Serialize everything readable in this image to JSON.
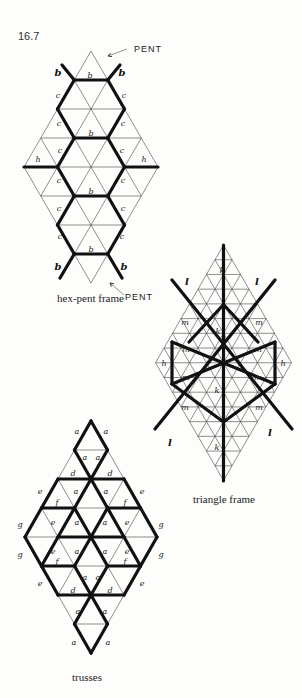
{
  "figure_number": "16.7",
  "diagrams": [
    {
      "id": "hex-pent",
      "caption": "hex-pent frame",
      "cx": 91,
      "top": 51,
      "edge": 33.5,
      "rowh": 29,
      "rows": 8,
      "bold": [
        [
          [
            1,
            0
          ],
          [
            1,
            1
          ]
        ],
        [
          [
            1,
            0
          ],
          [
            2,
            0
          ]
        ],
        [
          [
            1,
            1
          ],
          [
            2,
            2
          ]
        ],
        [
          [
            2,
            0
          ],
          [
            3,
            1
          ]
        ],
        [
          [
            2,
            2
          ],
          [
            3,
            2
          ]
        ],
        [
          [
            3,
            1
          ],
          [
            3,
            2
          ]
        ],
        [
          [
            3,
            1
          ],
          [
            4,
            1
          ]
        ],
        [
          [
            3,
            2
          ],
          [
            4,
            3
          ]
        ],
        [
          [
            4,
            0
          ],
          [
            4,
            1
          ]
        ],
        [
          [
            4,
            3
          ],
          [
            4,
            4
          ]
        ],
        [
          [
            4,
            1
          ],
          [
            5,
            1
          ]
        ],
        [
          [
            4,
            3
          ],
          [
            5,
            2
          ]
        ],
        [
          [
            5,
            1
          ],
          [
            5,
            2
          ]
        ],
        [
          [
            5,
            1
          ],
          [
            6,
            0
          ]
        ],
        [
          [
            5,
            2
          ],
          [
            6,
            2
          ]
        ],
        [
          [
            6,
            0
          ],
          [
            7,
            0
          ]
        ],
        [
          [
            6,
            2
          ],
          [
            7,
            1
          ]
        ],
        [
          [
            7,
            0
          ],
          [
            7,
            1
          ]
        ]
      ],
      "spurs": [
        [
          62,
          65,
          74.25,
          80
        ],
        [
          120,
          65,
          107.75,
          80
        ],
        [
          74.25,
          254,
          60,
          278
        ],
        [
          107.75,
          254,
          122,
          278
        ]
      ],
      "labels": [
        {
          "t": "b",
          "x": 58,
          "y": 76,
          "big": true
        },
        {
          "t": "b",
          "x": 90,
          "y": 78
        },
        {
          "t": "b",
          "x": 122,
          "y": 76,
          "big": true
        },
        {
          "t": "c",
          "x": 58,
          "y": 98
        },
        {
          "t": "c",
          "x": 124,
          "y": 98
        },
        {
          "t": "c",
          "x": 59,
          "y": 126
        },
        {
          "t": "b",
          "x": 91,
          "y": 136
        },
        {
          "t": "c",
          "x": 123,
          "y": 126
        },
        {
          "t": "c",
          "x": 60,
          "y": 153
        },
        {
          "t": "h",
          "x": 38,
          "y": 162
        },
        {
          "t": "c",
          "x": 122,
          "y": 153
        },
        {
          "t": "h",
          "x": 144,
          "y": 162
        },
        {
          "t": "c",
          "x": 59,
          "y": 183
        },
        {
          "t": "b",
          "x": 91,
          "y": 194
        },
        {
          "t": "c",
          "x": 123,
          "y": 183
        },
        {
          "t": "c",
          "x": 59,
          "y": 211
        },
        {
          "t": "c",
          "x": 123,
          "y": 211
        },
        {
          "t": "c",
          "x": 60,
          "y": 239
        },
        {
          "t": "b",
          "x": 91,
          "y": 252
        },
        {
          "t": "c",
          "x": 122,
          "y": 239
        },
        {
          "t": "b",
          "x": 58,
          "y": 270,
          "big": true
        },
        {
          "t": "b",
          "x": 124,
          "y": 270,
          "big": true
        }
      ],
      "caption_pos": [
        57,
        292
      ]
    },
    {
      "id": "triangle",
      "caption": "triangle frame",
      "cx": 223.5,
      "top": 245,
      "edge": 17,
      "rowh": 14.72,
      "rows": 16,
      "bold_lines": [
        [
          223.5,
          245,
          223.5,
          481
        ],
        [
          172,
          280,
          292,
          429
        ],
        [
          275,
          280,
          155,
          429
        ],
        [
          189,
          342,
          223.5,
          304.5
        ],
        [
          223.5,
          304.5,
          258,
          342
        ],
        [
          172,
          342,
          172,
          384
        ],
        [
          275,
          342,
          275,
          384
        ],
        [
          172,
          342,
          275,
          384
        ],
        [
          275,
          342,
          172,
          384
        ],
        [
          172,
          384,
          223.5,
          422
        ],
        [
          275,
          384,
          223.5,
          422
        ]
      ],
      "labels": [
        {
          "t": "k",
          "x": 222,
          "y": 273
        },
        {
          "t": "l",
          "x": 187,
          "y": 285,
          "big": true
        },
        {
          "t": "l",
          "x": 257,
          "y": 285,
          "big": true
        },
        {
          "t": "m",
          "x": 185,
          "y": 325
        },
        {
          "t": "m",
          "x": 259,
          "y": 325
        },
        {
          "t": "k",
          "x": 218,
          "y": 334
        },
        {
          "t": "m",
          "x": 186,
          "y": 352
        },
        {
          "t": "m",
          "x": 258,
          "y": 352
        },
        {
          "t": "h",
          "x": 164,
          "y": 366
        },
        {
          "t": "h",
          "x": 283,
          "y": 366
        },
        {
          "t": "m",
          "x": 186,
          "y": 380
        },
        {
          "t": "m",
          "x": 258,
          "y": 380
        },
        {
          "t": "k",
          "x": 217,
          "y": 393
        },
        {
          "t": "m",
          "x": 185,
          "y": 410
        },
        {
          "t": "m",
          "x": 259,
          "y": 410
        },
        {
          "t": "l",
          "x": 170,
          "y": 446,
          "big": true
        },
        {
          "t": "l",
          "x": 270,
          "y": 436,
          "big": true
        },
        {
          "t": "k",
          "x": 217,
          "y": 450
        }
      ],
      "caption_pos": [
        193,
        493
      ]
    },
    {
      "id": "trusses",
      "caption": "trusses",
      "cx": 91,
      "top": 421,
      "edge": 33,
      "rowh": 29,
      "rows": 8,
      "bold": [
        [
          [
            0,
            0
          ],
          [
            1,
            0
          ]
        ],
        [
          [
            0,
            0
          ],
          [
            1,
            1
          ]
        ],
        [
          [
            1,
            0
          ],
          [
            2,
            1
          ]
        ],
        [
          [
            1,
            1
          ],
          [
            2,
            1
          ]
        ],
        [
          [
            2,
            0
          ],
          [
            2,
            1
          ]
        ],
        [
          [
            2,
            1
          ],
          [
            2,
            2
          ]
        ],
        [
          [
            2,
            0
          ],
          [
            3,
            0
          ]
        ],
        [
          [
            2,
            2
          ],
          [
            3,
            3
          ]
        ],
        [
          [
            2,
            1
          ],
          [
            3,
            1
          ]
        ],
        [
          [
            2,
            1
          ],
          [
            3,
            2
          ]
        ],
        [
          [
            3,
            0
          ],
          [
            3,
            1
          ]
        ],
        [
          [
            3,
            2
          ],
          [
            3,
            3
          ]
        ],
        [
          [
            3,
            0
          ],
          [
            4,
            0
          ]
        ],
        [
          [
            3,
            3
          ],
          [
            4,
            4
          ]
        ],
        [
          [
            3,
            1
          ],
          [
            4,
            1
          ]
        ],
        [
          [
            3,
            1
          ],
          [
            4,
            2
          ]
        ],
        [
          [
            3,
            2
          ],
          [
            4,
            2
          ]
        ],
        [
          [
            3,
            2
          ],
          [
            4,
            3
          ]
        ],
        [
          [
            4,
            1
          ],
          [
            4,
            2
          ]
        ],
        [
          [
            4,
            2
          ],
          [
            4,
            3
          ]
        ],
        [
          [
            4,
            0
          ],
          [
            5,
            0
          ]
        ],
        [
          [
            4,
            4
          ],
          [
            5,
            3
          ]
        ],
        [
          [
            4,
            1
          ],
          [
            5,
            0
          ]
        ],
        [
          [
            4,
            2
          ],
          [
            5,
            1
          ]
        ],
        [
          [
            4,
            2
          ],
          [
            5,
            2
          ]
        ],
        [
          [
            4,
            3
          ],
          [
            5,
            3
          ]
        ],
        [
          [
            5,
            0
          ],
          [
            5,
            1
          ]
        ],
        [
          [
            5,
            2
          ],
          [
            5,
            3
          ]
        ],
        [
          [
            5,
            0
          ],
          [
            6,
            0
          ]
        ],
        [
          [
            5,
            3
          ],
          [
            6,
            2
          ]
        ],
        [
          [
            5,
            1
          ],
          [
            6,
            1
          ]
        ],
        [
          [
            5,
            2
          ],
          [
            6,
            1
          ]
        ],
        [
          [
            6,
            0
          ],
          [
            6,
            1
          ]
        ],
        [
          [
            6,
            1
          ],
          [
            6,
            2
          ]
        ],
        [
          [
            6,
            1
          ],
          [
            7,
            0
          ]
        ],
        [
          [
            6,
            1
          ],
          [
            7,
            1
          ]
        ],
        [
          [
            7,
            0
          ],
          [
            8,
            0
          ]
        ],
        [
          [
            7,
            1
          ],
          [
            8,
            0
          ]
        ]
      ],
      "labels": [
        {
          "t": "a",
          "x": 77,
          "y": 434
        },
        {
          "t": "a",
          "x": 106,
          "y": 434
        },
        {
          "t": "a",
          "x": 85,
          "y": 460
        },
        {
          "t": "a",
          "x": 98,
          "y": 460
        },
        {
          "t": "d",
          "x": 73,
          "y": 476
        },
        {
          "t": "d",
          "x": 110,
          "y": 476
        },
        {
          "t": "e",
          "x": 40,
          "y": 494
        },
        {
          "t": "a",
          "x": 76,
          "y": 494
        },
        {
          "t": "a",
          "x": 106,
          "y": 494
        },
        {
          "t": "e",
          "x": 142,
          "y": 494
        },
        {
          "t": "f",
          "x": 57,
          "y": 505
        },
        {
          "t": "f",
          "x": 125,
          "y": 505
        },
        {
          "t": "g",
          "x": 20,
          "y": 527
        },
        {
          "t": "e",
          "x": 53,
          "y": 525
        },
        {
          "t": "a",
          "x": 77,
          "y": 525
        },
        {
          "t": "a",
          "x": 105,
          "y": 525
        },
        {
          "t": "e",
          "x": 127,
          "y": 525
        },
        {
          "t": "g",
          "x": 161,
          "y": 527
        },
        {
          "t": "g",
          "x": 20,
          "y": 557
        },
        {
          "t": "e",
          "x": 53,
          "y": 554
        },
        {
          "t": "a",
          "x": 77,
          "y": 554
        },
        {
          "t": "a",
          "x": 105,
          "y": 554
        },
        {
          "t": "e",
          "x": 127,
          "y": 554
        },
        {
          "t": "g",
          "x": 161,
          "y": 557
        },
        {
          "t": "f",
          "x": 57,
          "y": 564
        },
        {
          "t": "f",
          "x": 125,
          "y": 564
        },
        {
          "t": "e",
          "x": 40,
          "y": 586
        },
        {
          "t": "a",
          "x": 85,
          "y": 580
        },
        {
          "t": "a",
          "x": 98,
          "y": 580
        },
        {
          "t": "e",
          "x": 142,
          "y": 586
        },
        {
          "t": "d",
          "x": 73,
          "y": 593
        },
        {
          "t": "d",
          "x": 110,
          "y": 593
        },
        {
          "t": "a",
          "x": 78,
          "y": 614
        },
        {
          "t": "a",
          "x": 105,
          "y": 614
        },
        {
          "t": "a",
          "x": 74,
          "y": 645
        },
        {
          "t": "a",
          "x": 108,
          "y": 645
        }
      ],
      "caption_pos": [
        72,
        671
      ]
    }
  ],
  "annotations": [
    {
      "text": "PENT",
      "x": 134,
      "y": 52,
      "arrow": [
        127,
        49,
        108,
        56
      ]
    },
    {
      "text": "PENT",
      "x": 125,
      "y": 300,
      "arrow": [
        124,
        295,
        110,
        283
      ]
    }
  ]
}
